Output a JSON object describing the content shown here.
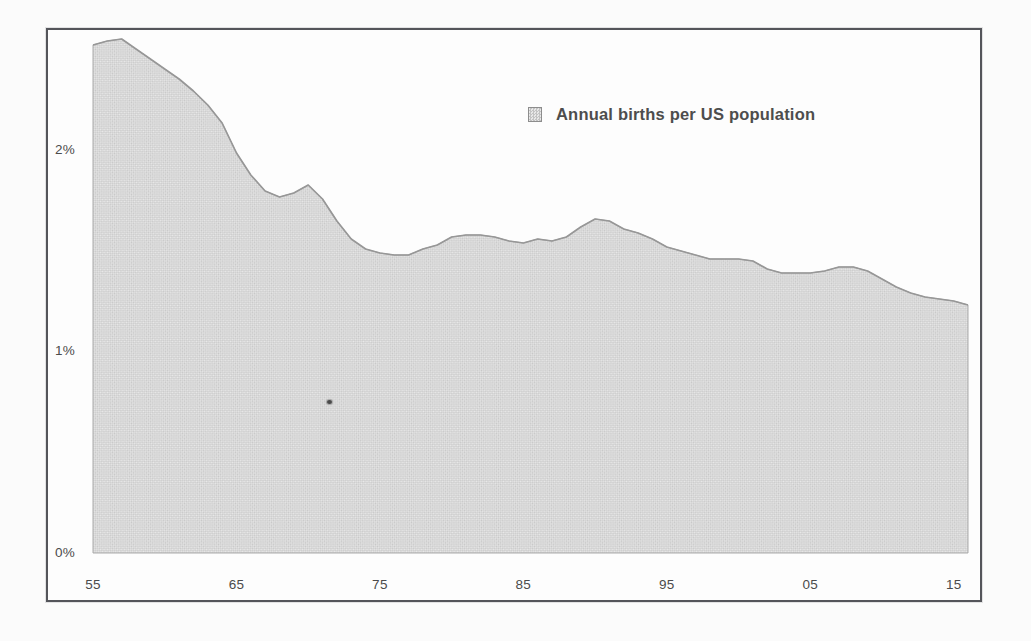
{
  "page": {
    "background": "#fbfbfb"
  },
  "frame": {
    "border_color": "#54555a"
  },
  "legend": {
    "label": "Annual births per US population",
    "swatch_fill": "#d9d9d9",
    "swatch_border": "#8d8d8d",
    "text_color": "#4d4d4d"
  },
  "axes": {
    "tick_color": "#4b4b4b",
    "y_ticks": [
      {
        "label": "0%",
        "value": 0
      },
      {
        "label": "1%",
        "value": 1
      },
      {
        "label": "2%",
        "value": 2
      }
    ],
    "x_ticks": [
      {
        "label": "55",
        "year": 1955
      },
      {
        "label": "65",
        "year": 1965
      },
      {
        "label": "75",
        "year": 1975
      },
      {
        "label": "85",
        "year": 1985
      },
      {
        "label": "95",
        "year": 1995
      },
      {
        "label": "05",
        "year": 2005
      },
      {
        "label": "15",
        "year": 2015
      }
    ]
  },
  "chart_data": {
    "type": "area",
    "title": "",
    "xlabel": "",
    "ylabel": "",
    "legend_entries": [
      "Annual births per US population"
    ],
    "legend_position": "top-center",
    "grid": false,
    "xlim": [
      1955,
      2016
    ],
    "ylim": [
      0,
      2.65
    ],
    "x_tick_labels": [
      "55",
      "65",
      "75",
      "85",
      "95",
      "05",
      "15"
    ],
    "y_tick_labels": [
      "0%",
      "1%",
      "2%"
    ],
    "area_fill": "#d8d8d8",
    "edge_color": "#979797",
    "x": [
      1955,
      1956,
      1957,
      1958,
      1959,
      1960,
      1961,
      1962,
      1963,
      1964,
      1965,
      1966,
      1967,
      1968,
      1969,
      1970,
      1971,
      1972,
      1973,
      1974,
      1975,
      1976,
      1977,
      1978,
      1979,
      1980,
      1981,
      1982,
      1983,
      1984,
      1985,
      1986,
      1987,
      1988,
      1989,
      1990,
      1991,
      1992,
      1993,
      1994,
      1995,
      1996,
      1997,
      1998,
      1999,
      2000,
      2001,
      2002,
      2003,
      2004,
      2005,
      2006,
      2007,
      2008,
      2009,
      2010,
      2011,
      2012,
      2013,
      2014,
      2015,
      2016
    ],
    "series": [
      {
        "name": "Annual births per US population",
        "unit": "percent",
        "values": [
          2.54,
          2.56,
          2.57,
          2.52,
          2.47,
          2.42,
          2.37,
          2.31,
          2.24,
          2.15,
          2.0,
          1.89,
          1.81,
          1.78,
          1.8,
          1.84,
          1.77,
          1.66,
          1.57,
          1.52,
          1.5,
          1.49,
          1.49,
          1.52,
          1.54,
          1.58,
          1.59,
          1.59,
          1.58,
          1.56,
          1.55,
          1.57,
          1.56,
          1.58,
          1.63,
          1.67,
          1.66,
          1.62,
          1.6,
          1.57,
          1.53,
          1.51,
          1.49,
          1.47,
          1.47,
          1.47,
          1.46,
          1.42,
          1.4,
          1.4,
          1.4,
          1.41,
          1.43,
          1.43,
          1.41,
          1.37,
          1.33,
          1.3,
          1.28,
          1.27,
          1.26,
          1.24
        ]
      }
    ]
  },
  "artifacts": {
    "ink_speck": {
      "x": 327,
      "y": 400
    }
  }
}
